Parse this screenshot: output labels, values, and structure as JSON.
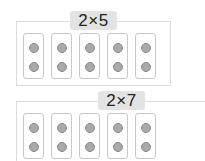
{
  "groups": [
    {
      "label": "2×5",
      "cards": 5,
      "dots_per_card": 2
    },
    {
      "label": "2×7",
      "cards": 5,
      "dots_per_card": 2
    }
  ],
  "colors": {
    "dot": "#a9a9a9",
    "badge_bg": "#e3e3e3",
    "border": "#c8c8c8"
  }
}
